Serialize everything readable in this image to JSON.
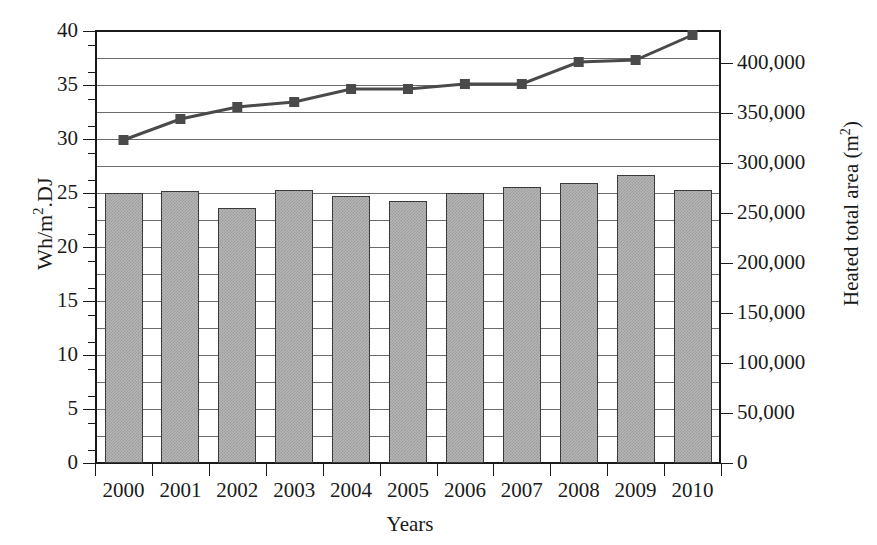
{
  "figure": {
    "cropped_title_fragment": "",
    "xlabel": "Years",
    "ylabel_left": "Wh/m².DJ",
    "ylabel_right": "Heated total area (m²)"
  },
  "axes": {
    "left_ticks": [
      "0",
      "5",
      "10",
      "15",
      "20",
      "25",
      "30",
      "35",
      "40"
    ],
    "right_ticks": [
      "0",
      "50,000",
      "100,000",
      "150,000",
      "200,000",
      "250,000",
      "300,000",
      "350,000",
      "400,000"
    ],
    "x_ticks": [
      "2000",
      "2001",
      "2002",
      "2003",
      "2004",
      "2005",
      "2006",
      "2007",
      "2008",
      "2009",
      "2010"
    ]
  },
  "colors": {
    "bar_fill": "#b6b6b6",
    "bar_border": "#3a3a3a",
    "line": "#4a4a4a",
    "marker": "#4a4a4a",
    "gridline": "#6b6b6b",
    "axis": "#1a1a1a"
  },
  "chart_data": {
    "type": "bar",
    "title": "",
    "xlabel": "Years",
    "ylabel": "Wh/m².DJ",
    "ylabel_secondary": "Heated total area (m²)",
    "categories": [
      "2000",
      "2001",
      "2002",
      "2003",
      "2004",
      "2005",
      "2006",
      "2007",
      "2008",
      "2009",
      "2010"
    ],
    "ylim": [
      0,
      40
    ],
    "ylim_secondary": [
      0,
      432000
    ],
    "yticks": [
      0,
      5,
      10,
      15,
      20,
      25,
      30,
      35,
      40
    ],
    "yticks_secondary": [
      0,
      50000,
      100000,
      150000,
      200000,
      250000,
      300000,
      350000,
      400000
    ],
    "grid": true,
    "grid_interval": 2.5,
    "legend": "none",
    "series": [
      {
        "name": "Specific energy consumption",
        "type": "bar",
        "axis": "left",
        "unit": "Wh/m².DJ",
        "values": [
          25.0,
          25.2,
          23.6,
          25.3,
          24.7,
          24.3,
          25.0,
          25.6,
          25.9,
          26.7,
          25.3
        ]
      },
      {
        "name": "Heated total area",
        "type": "line",
        "axis": "right",
        "unit": "m²",
        "marker": "square",
        "values": [
          323000,
          344000,
          356000,
          361000,
          374000,
          374000,
          379000,
          379000,
          401000,
          403000,
          428000
        ],
        "values_left_axis_equivalent": [
          30.0,
          31.9,
          33.0,
          33.5,
          34.7,
          34.7,
          35.2,
          35.2,
          37.2,
          37.4,
          39.7
        ]
      }
    ]
  }
}
